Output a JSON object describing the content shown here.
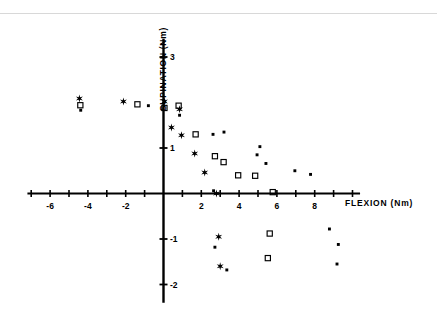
{
  "figure": {
    "background_color": "#ffffff",
    "ink_color": "#000000",
    "top_rule_color": "#d8d8d8"
  },
  "chart_data": {
    "type": "scatter",
    "title": "",
    "subtitle": "",
    "xlabel": "FLEXION   (Nm)",
    "ylabel": "SUPINATION  (Nm)",
    "xlim": [
      -7.2,
      10.4
    ],
    "ylim": [
      -2.4,
      3.4
    ],
    "xticks": [
      -7,
      -6,
      -5,
      -4,
      -3,
      -2,
      -1,
      0,
      1,
      2,
      3,
      4,
      5,
      6,
      7,
      8,
      9,
      10
    ],
    "xtick_labels": [
      {
        "value": -6,
        "text": "-6"
      },
      {
        "value": -4,
        "text": "-4"
      },
      {
        "value": -2,
        "text": "-2"
      },
      {
        "value": 2,
        "text": "2"
      },
      {
        "value": 4,
        "text": "4"
      },
      {
        "value": 6,
        "text": "6"
      },
      {
        "value": 8,
        "text": "8"
      }
    ],
    "yticks": [
      -2,
      -1,
      1,
      3
    ],
    "ytick_labels": [
      {
        "value": 3,
        "text": "3"
      },
      {
        "value": 1,
        "text": "1"
      },
      {
        "value": -1,
        "text": "-1"
      },
      {
        "value": -2,
        "text": "-2"
      }
    ],
    "grid": false,
    "legend": "none",
    "axes_style": "crossed-at-origin",
    "series": [
      {
        "name": "star",
        "marker": "star",
        "color": "#000000",
        "points": [
          [
            -4.45,
            2.09
          ],
          [
            -2.12,
            2.02
          ],
          [
            0.05,
            2.02
          ],
          [
            0.85,
            1.85
          ],
          [
            0.42,
            1.45
          ],
          [
            0.95,
            1.28
          ],
          [
            1.65,
            0.88
          ],
          [
            2.18,
            0.46
          ],
          [
            2.8,
            0.0
          ],
          [
            2.92,
            -0.95
          ],
          [
            3.0,
            -1.6
          ]
        ]
      },
      {
        "name": "square",
        "marker": "square",
        "color": "#000000",
        "points": [
          [
            -4.4,
            1.94
          ],
          [
            -1.38,
            1.96
          ],
          [
            0.05,
            1.88
          ],
          [
            0.8,
            1.93
          ],
          [
            1.7,
            1.3
          ],
          [
            2.72,
            0.82
          ],
          [
            3.18,
            0.69
          ],
          [
            3.95,
            0.4
          ],
          [
            4.85,
            0.39
          ],
          [
            5.78,
            0.03
          ],
          [
            5.62,
            -0.88
          ],
          [
            5.52,
            -1.42
          ]
        ]
      },
      {
        "name": "dot",
        "marker": "dot",
        "color": "#000000",
        "points": [
          [
            -4.38,
            1.83
          ],
          [
            -0.8,
            1.93
          ],
          [
            0.85,
            1.72
          ],
          [
            2.62,
            1.3
          ],
          [
            3.2,
            1.35
          ],
          [
            5.1,
            1.03
          ],
          [
            4.95,
            0.85
          ],
          [
            5.42,
            0.66
          ],
          [
            6.95,
            0.5
          ],
          [
            7.78,
            0.42
          ],
          [
            2.65,
            0.06
          ],
          [
            8.78,
            -0.78
          ],
          [
            2.72,
            -1.18
          ],
          [
            9.25,
            -1.12
          ],
          [
            3.35,
            -1.68
          ],
          [
            9.18,
            -1.55
          ]
        ]
      }
    ]
  }
}
